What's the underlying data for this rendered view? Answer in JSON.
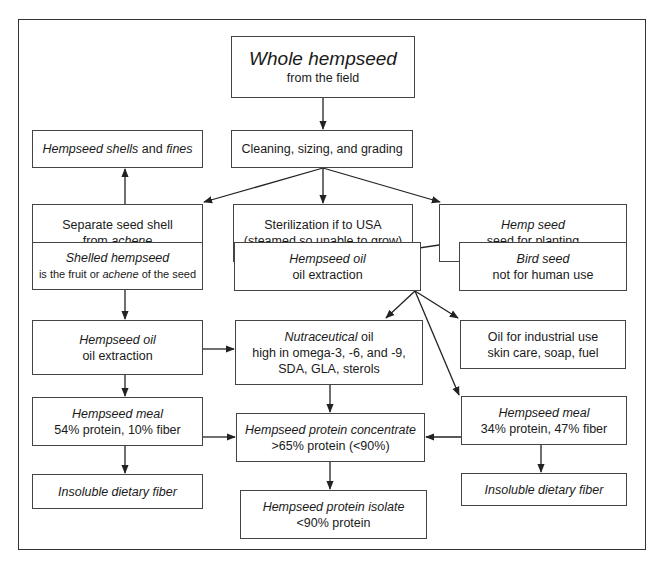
{
  "diagram": {
    "nodes": {
      "whole": {
        "title": "Whole hempseed",
        "sub": "from the field"
      },
      "cleaning": {
        "label": "Cleaning, sizing, and grading"
      },
      "shells": {
        "title_a": "Hempseed shells",
        "mid": " and ",
        "title_b": "fines"
      },
      "separate": {
        "line1": "Separate seed shell",
        "pre": "from ",
        "em": "achene"
      },
      "steril": {
        "line1": "Sterilization if to USA",
        "line2": "(steamed so unable to grow)"
      },
      "hempseed_plant": {
        "title": "Hemp seed",
        "sub": "seed for planting"
      },
      "shelled": {
        "title": "Shelled hempseed",
        "pre": "is the fruit or ",
        "em": "achene",
        "post": " of the seed"
      },
      "oil_mid": {
        "title": "Hempseed oil",
        "sub": "oil extraction"
      },
      "bird": {
        "title": "Bird seed",
        "sub": "not for human use"
      },
      "oil_left": {
        "title": "Hempseed oil",
        "sub": "oil extraction"
      },
      "nutra": {
        "em": "Nutraceutical",
        "post": " oil",
        "line2": "high in omega-3, -6, and -9,",
        "line3": "SDA, GLA, sterols"
      },
      "industrial": {
        "line1": "Oil for industrial use",
        "line2": "skin care, soap, fuel"
      },
      "meal_left": {
        "title": "Hempseed meal",
        "sub": "54% protein, 10% fiber"
      },
      "concentrate": {
        "title": "Hempseed protein concentrate",
        "sub": ">65% protein (<90%)"
      },
      "meal_right": {
        "title": "Hempseed meal",
        "sub": "34% protein, 47% fiber"
      },
      "fiber_left": {
        "title": "Insoluble dietary fiber"
      },
      "isolate": {
        "title": "Hempseed protein isolate",
        "sub": "<90% protein"
      },
      "fiber_right": {
        "title": "Insoluble dietary fiber"
      }
    },
    "colors": {
      "line": "#222222",
      "border": "#444444",
      "background": "#ffffff"
    }
  }
}
